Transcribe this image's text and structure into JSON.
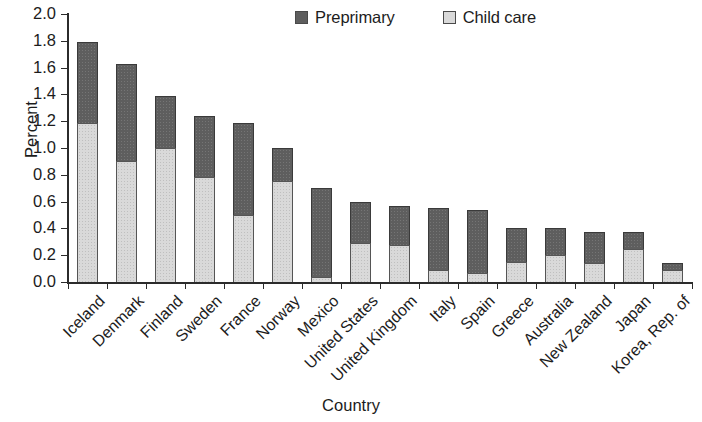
{
  "chart_data": {
    "type": "bar",
    "subtype": "stacked-vertical",
    "title": "",
    "xlabel": "Country",
    "ylabel": "Percent",
    "ylim": [
      0.0,
      2.0
    ],
    "ytick_labels": [
      "2.0",
      "1.8",
      "1.6",
      "1.4",
      "1.2",
      "1.0",
      "0.8",
      "0.6",
      "0.4",
      "0.2",
      "0.0"
    ],
    "ytick_values": [
      2.0,
      1.8,
      1.6,
      1.4,
      1.2,
      1.0,
      0.8,
      0.6,
      0.4,
      0.2,
      0.0
    ],
    "grid": false,
    "legend_position": "top",
    "categories": [
      "Iceland",
      "Denmark",
      "Finland",
      "Sweden",
      "France",
      "Norway",
      "Mexico",
      "United States",
      "United Kingdom",
      "Italy",
      "Spain",
      "Greece",
      "Australia",
      "New Zealand",
      "Japan",
      "Korea, Rep. of"
    ],
    "series": [
      {
        "name": "Child care",
        "color": "#d9d9d9",
        "values": [
          1.19,
          0.9,
          1.0,
          0.78,
          0.5,
          0.755,
          0.04,
          0.29,
          0.275,
          0.09,
          0.07,
          0.15,
          0.2,
          0.145,
          0.245,
          0.09
        ]
      },
      {
        "name": "Preprimary",
        "color": "#5e5e5e",
        "values": [
          0.6,
          0.73,
          0.385,
          0.46,
          0.69,
          0.245,
          0.66,
          0.31,
          0.295,
          0.465,
          0.465,
          0.25,
          0.2,
          0.23,
          0.13,
          0.055
        ]
      }
    ],
    "totals": [
      1.79,
      1.63,
      1.385,
      1.24,
      1.19,
      1.0,
      0.7,
      0.6,
      0.57,
      0.555,
      0.535,
      0.4,
      0.4,
      0.375,
      0.375,
      0.145
    ]
  },
  "legend": {
    "items": [
      {
        "label": "Preprimary",
        "swatch": "dark-gray-swatch-icon",
        "color": "#5e5e5e"
      },
      {
        "label": "Child care",
        "swatch": "light-gray-swatch-icon",
        "color": "#d9d9d9"
      }
    ]
  }
}
